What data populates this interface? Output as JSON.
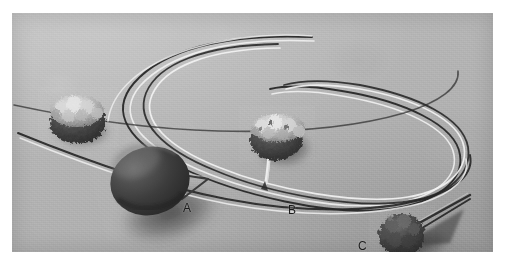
{
  "figure": {
    "kind": "photograph",
    "background_color": "#b2b2b2",
    "plate_border_color": "#ffffff",
    "label_color": "#1b1b1b",
    "plate": {
      "left": 12,
      "top": 13,
      "width": 481,
      "height": 239
    }
  },
  "labels": [
    {
      "id": "A",
      "text": "A",
      "x": 171,
      "y": 189,
      "refers_to": "dark smooth ovoid pendant with wire pin, lower left"
    },
    {
      "id": "B",
      "text": "B",
      "x": 276,
      "y": 191,
      "refers_to": "light granular bead on cord, centre"
    },
    {
      "id": "C",
      "text": "C",
      "x": 346,
      "y": 227,
      "refers_to": "dark granular bead with wire, lower right"
    }
  ],
  "objects": [
    {
      "name": "granular-bead-upper-left",
      "type": "bead",
      "surface": "rough granular, pale highlights over dark lower half",
      "center": [
        66,
        105
      ],
      "radius_x": 29,
      "radius_y": 22,
      "tone": "light"
    },
    {
      "name": "ovoid-pendant-a",
      "type": "pendant",
      "surface": "smooth dark polished ovoid with specular highlight on upper left",
      "center": [
        138,
        168
      ],
      "radius_x": 40,
      "radius_y": 33,
      "tone": "dark",
      "has_wire": true,
      "label": "A"
    },
    {
      "name": "granular-bead-b",
      "type": "bead",
      "surface": "rough granular pale cap over dark body, pale cord tail below",
      "center": [
        268,
        122
      ],
      "radius_x": 27,
      "radius_y": 21,
      "tone": "mixed",
      "has_wire": true,
      "label": "B"
    },
    {
      "name": "granular-bead-c",
      "type": "bead",
      "surface": "dark rough granular, double wire prong to the right",
      "center": [
        392,
        222
      ],
      "radius_x": 22,
      "radius_y": 20,
      "tone": "dark",
      "has_wire": true,
      "label": "C"
    }
  ],
  "cords": {
    "name": "looped-cords",
    "count": 2,
    "description": "Two long thin cords forming overlapping elongated loops across the upper half of the plate, each rendered as a dark line paired with a white specular highlight"
  }
}
